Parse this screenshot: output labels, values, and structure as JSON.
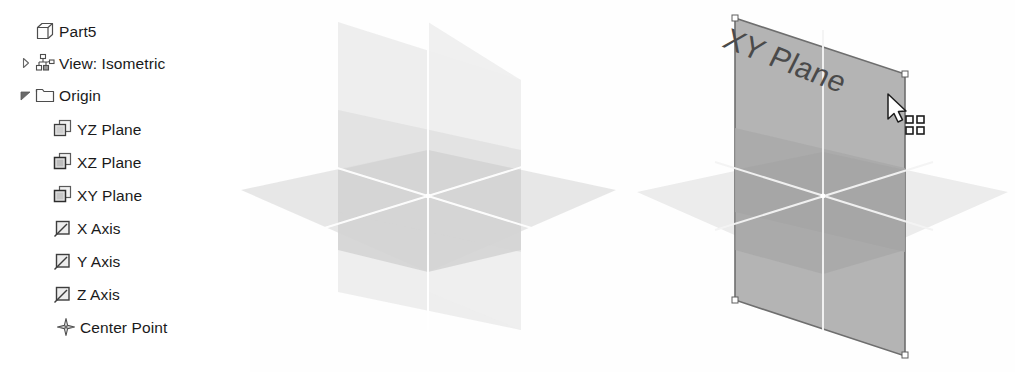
{
  "app": {
    "document_name": "Part5",
    "view_state": "View: Isometric"
  },
  "tree": {
    "name": "model-browser",
    "items": [
      {
        "id": "part5",
        "label": "Part5",
        "icon": "part-cube-icon",
        "indent": 0,
        "twisty": "none",
        "selected": false
      },
      {
        "id": "view-isometric",
        "label": "View: Isometric",
        "icon": "view-hierarchy-icon",
        "indent": 0,
        "twisty": "collapsed",
        "selected": false
      },
      {
        "id": "origin",
        "label": "Origin",
        "icon": "folder-icon",
        "indent": 0,
        "twisty": "expanded",
        "selected": false
      },
      {
        "id": "yz-plane",
        "label": "YZ Plane",
        "icon": "plane-icon",
        "indent": 1,
        "twisty": "none",
        "selected": false
      },
      {
        "id": "xz-plane",
        "label": "XZ Plane",
        "icon": "plane-icon",
        "indent": 1,
        "twisty": "none",
        "selected": false
      },
      {
        "id": "xy-plane",
        "label": "XY Plane",
        "icon": "plane-icon",
        "indent": 1,
        "twisty": "none",
        "selected": false
      },
      {
        "id": "x-axis",
        "label": "X Axis",
        "icon": "axis-icon",
        "indent": 1,
        "twisty": "none",
        "selected": false
      },
      {
        "id": "y-axis",
        "label": "Y Axis",
        "icon": "axis-icon",
        "indent": 1,
        "twisty": "none",
        "selected": false
      },
      {
        "id": "z-axis",
        "label": "Z Axis",
        "icon": "axis-icon",
        "indent": 1,
        "twisty": "none",
        "selected": false
      },
      {
        "id": "center-point",
        "label": "Center Point",
        "icon": "center-point-icon",
        "indent": 1,
        "twisty": "none",
        "selected": false
      }
    ]
  },
  "viewports": [
    {
      "id": "viewport-left",
      "name": "origin-planes-unselected",
      "description": "Three origin work planes shown in isometric view, none highlighted",
      "planes": [
        "YZ Plane",
        "XZ Plane",
        "XY Plane"
      ],
      "highlighted_plane": null,
      "label": ""
    },
    {
      "id": "viewport-right",
      "name": "origin-planes-xy-highlighted",
      "description": "Same three origin work planes with the XY Plane pre-highlighted under the cursor",
      "planes": [
        "YZ Plane",
        "XZ Plane",
        "XY Plane"
      ],
      "highlighted_plane": "XY Plane",
      "label": "XY Plane"
    }
  ],
  "cursor": {
    "name": "select-plane-cursor",
    "badge": "select-face-badge",
    "x": 893,
    "y": 98
  },
  "colors": {
    "plane_fill_light": "#ebebeb",
    "plane_fill_mid": "#d8d8d8",
    "plane_fill_dark": "#c4c4c4",
    "plane_highlight": "#b9b9b9",
    "plane_highlight_edge": "#6e6e6e",
    "intersection_line": "#ffffff",
    "text": "#1a1a1a",
    "label_text": "#4a4a4a",
    "icon_outline": "#4d4d4d",
    "handle_fill": "#ffffff"
  }
}
